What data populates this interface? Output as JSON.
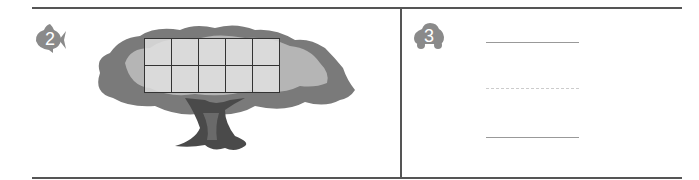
{
  "problems": [
    {
      "number": "2",
      "badge_icon": "fish-icon",
      "illustration": "tree-icon",
      "ten_frame": {
        "rows": 2,
        "cols": 5,
        "filled": 0
      }
    },
    {
      "number": "3",
      "badge_icon": "car-icon",
      "writing_lines": [
        "solid",
        "dashed",
        "solid"
      ]
    }
  ],
  "colors": {
    "border": "#555555",
    "badge": "#8a8a8a",
    "tree_canopy_dark": "#7a7a7a",
    "tree_canopy_light": "#b5b5b5",
    "trunk": "#4a4a4a"
  }
}
